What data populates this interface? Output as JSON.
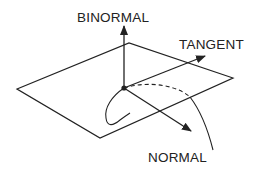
{
  "diagram": {
    "type": "frenet-serret-frame",
    "labels": {
      "binormal": "BINORMAL",
      "tangent": "TANGENT",
      "normal": "NORMAL"
    },
    "colors": {
      "stroke": "#222222",
      "background": "#ffffff"
    },
    "elements": {
      "plane": "osculating-plane parallelogram",
      "origin": "point on curve",
      "curve": "space curve passing through origin (dashed where behind plane)",
      "arrows": [
        "binormal (up)",
        "tangent (upper-right)",
        "normal (lower-right)"
      ]
    }
  }
}
